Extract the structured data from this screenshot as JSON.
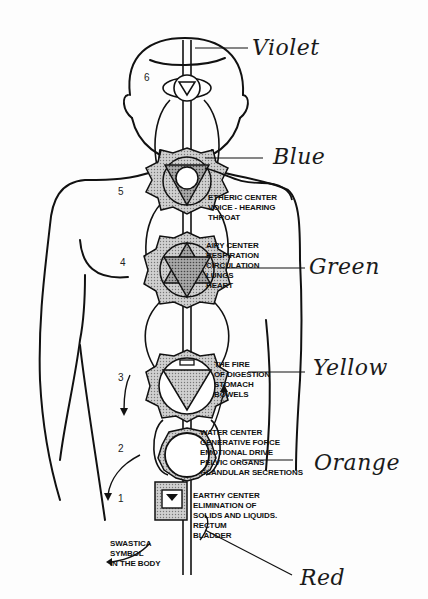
{
  "diagram": {
    "type": "chakra body diagram",
    "color_labels": [
      {
        "id": "violet",
        "text": "Violet"
      },
      {
        "id": "blue",
        "text": "Blue"
      },
      {
        "id": "green",
        "text": "Green"
      },
      {
        "id": "yellow",
        "text": "Yellow"
      },
      {
        "id": "orange",
        "text": "Orange"
      },
      {
        "id": "red",
        "text": "Red"
      }
    ],
    "centers": [
      {
        "id": "throat",
        "lines": "ETHERIC CENTER\nVOICE - HEARING\nTHROAT"
      },
      {
        "id": "heart",
        "lines": "AIRY CENTER\nRESPIRATION\nCIRCULATION\nLUNGS\nHEART"
      },
      {
        "id": "solar",
        "lines": "THE FIRE\nOF DIGESTION\nSTOMACH\nBOWELS"
      },
      {
        "id": "sacral",
        "lines": "WATER CENTER\nGENERATIVE FORCE\nEMOTIONAL DRIVE\nPELVIC ORGANS\nGLANDULAR SECRETIONS"
      },
      {
        "id": "root",
        "lines": "EARTHY CENTER\nELIMINATION OF\nSOLIDS AND LIQUIDS.\nRECTUM\nBLADDER"
      }
    ],
    "swastica_note": "SWASTICA\nSYMBOL\nIN THE BODY",
    "numbers": [
      "6",
      "5",
      "4",
      "3",
      "2",
      "1"
    ]
  }
}
